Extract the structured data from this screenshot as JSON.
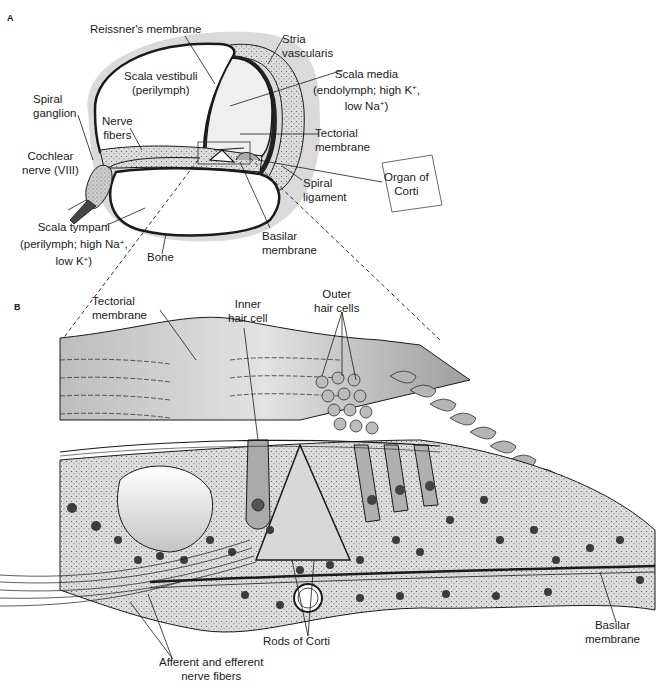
{
  "panels": {
    "a": {
      "letter": "A",
      "labels": {
        "reissner": "Reissner's membrane",
        "stria_1": "Stria",
        "stria_2": "vascularis",
        "scala_vestibuli_1": "Scala vestibuli",
        "scala_vestibuli_2": "(perilymph)",
        "scala_media_1": "Scala media",
        "scala_media_2": "(endolymph; high K",
        "scala_media_2_sup": "+",
        "scala_media_2_end": ",",
        "scala_media_3": "low Na",
        "scala_media_3_sup": "+",
        "scala_media_3_end": ")",
        "spiral_ganglion_1": "Spiral",
        "spiral_ganglion_2": "ganglion",
        "nerve_fibers_1": "Nerve",
        "nerve_fibers_2": "fibers",
        "tectorial_1": "Tectorial",
        "tectorial_2": "membrane",
        "cochlear_nerve_1": "Cochlear",
        "cochlear_nerve_2": "nerve (VIII)",
        "organ_of_corti_1": "Organ of",
        "organ_of_corti_2": "Corti",
        "spiral_ligament_1": "Spiral",
        "spiral_ligament_2": "ligament",
        "scala_tympani_1": "Scala tympani",
        "scala_tympani_2": "(perilymph; high Na",
        "scala_tympani_2_sup": "+",
        "scala_tympani_2_end": ",",
        "scala_tympani_3": "low K",
        "scala_tympani_3_sup": "+",
        "scala_tympani_3_end": ")",
        "bone": "Bone",
        "basilar_1": "Basilar",
        "basilar_2": "membrane"
      }
    },
    "b": {
      "letter": "B",
      "labels": {
        "tectorial_1": "Tectorial",
        "tectorial_2": "membrane",
        "inner_hair_1": "Inner",
        "inner_hair_2": "hair cell",
        "outer_hair_1": "Outer",
        "outer_hair_2": "hair cells",
        "rods_of_corti": "Rods of Corti",
        "basilar_1": "Basilar",
        "basilar_2": "membrane",
        "nerve_fibers_1": "Afferent and efferent",
        "nerve_fibers_2": "nerve fibers"
      }
    }
  },
  "colors": {
    "bone_halo": "#d9d9d9",
    "tissue": "#c8c8c8",
    "tissue_dark": "#8c8c8c",
    "outline": "#1a1a1a",
    "nucleus": "#4a4a4a"
  }
}
